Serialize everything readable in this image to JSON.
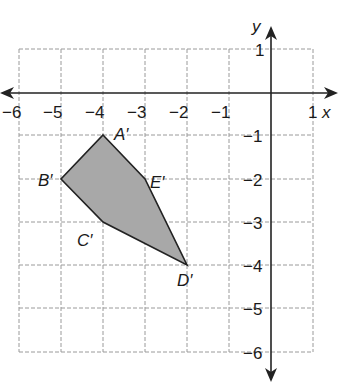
{
  "figure": {
    "type": "coordinate-plane",
    "axes": {
      "x_label": "x",
      "y_label": "y",
      "x_range": [
        -6,
        1
      ],
      "y_range": [
        -6,
        1
      ]
    },
    "x_ticks": [
      "−6",
      "−5",
      "−4",
      "−3",
      "−2",
      "−1",
      "1"
    ],
    "y_ticks": [
      "1",
      "−1",
      "−2",
      "−3",
      "−4",
      "−5",
      "−6"
    ],
    "polygon": {
      "fill": "#a8a8a8",
      "stroke": "#222222",
      "vertices": [
        {
          "label": "A′",
          "x": -4,
          "y": -1
        },
        {
          "label": "E′",
          "x": -3,
          "y": -2
        },
        {
          "label": "D′",
          "x": -2,
          "y": -4
        },
        {
          "label": "C′",
          "x": -4,
          "y": -3
        },
        {
          "label": "B′",
          "x": -5,
          "y": -2
        }
      ]
    }
  }
}
